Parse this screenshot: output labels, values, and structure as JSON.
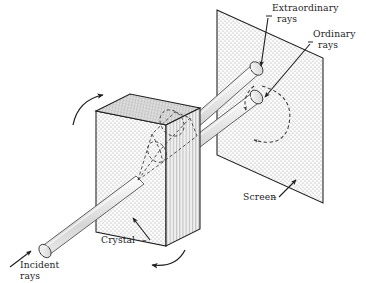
{
  "figure": {
    "width": 366,
    "height": 283,
    "background": "#ffffff",
    "ink": "#252525"
  },
  "labels": {
    "extraordinary_line1": "Extraordinary",
    "extraordinary_line2": "rays",
    "ordinary_line1": "Ordinary",
    "ordinary_line2": "rays",
    "screen": "Screen",
    "crystal": "Crystal",
    "incident_line1": "Incident",
    "incident_line2": "rays"
  },
  "objects": {
    "screen": {
      "name": "Screen",
      "shape": "parallelogram",
      "fill": "#f2f2f2",
      "texture": "stipple-dots",
      "stroke": "#1f1f1f"
    },
    "crystal": {
      "name": "Crystal",
      "shape": "parallelepiped",
      "front_face_texture": "stipple-dots",
      "top_face_texture": "diagonal-crosshatch",
      "right_face_texture": "vertical-stripes",
      "stroke": "#1f1f1f"
    },
    "incident_ray": {
      "name": "Incident rays",
      "shape": "cylinder",
      "fill": "#e3e3e3",
      "direction": "lower-left to upper-right"
    },
    "extraordinary_ray": {
      "name": "Extraordinary rays",
      "shape": "cylinder",
      "fill": "#e3e3e3",
      "terminates_at": "Screen"
    },
    "ordinary_ray": {
      "name": "Ordinary rays",
      "shape": "cylinder",
      "fill": "#e3e3e3",
      "terminates_at": "Screen"
    },
    "internal_path": {
      "name": "refracted-ray-path-inside-crystal",
      "style": "dashed"
    },
    "rotation_arrow_top": {
      "name": "crystal-rotation-arrow-top",
      "style": "curved-solid-arrow",
      "direction": "clockwise"
    },
    "rotation_arrow_bottom": {
      "name": "crystal-rotation-arrow-bottom",
      "style": "curved-solid-arrow",
      "direction": "clockwise"
    },
    "rotation_arrow_screen": {
      "name": "ray-rotation-arc-on-screen",
      "style": "dashed-curved-double-arrow"
    }
  }
}
